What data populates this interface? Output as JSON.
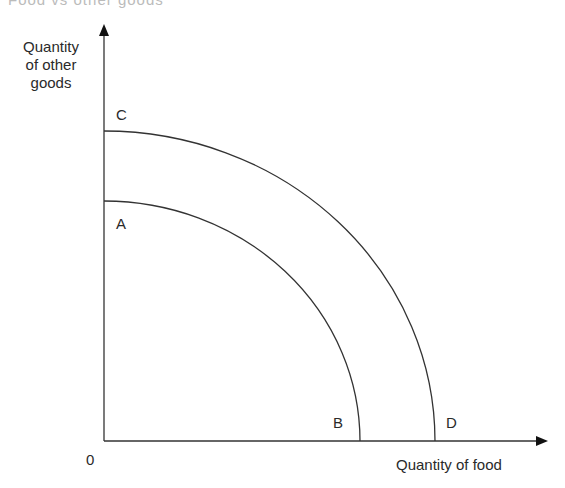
{
  "header": {
    "cut_text": "Food vs other goods"
  },
  "chart_data": {
    "type": "line",
    "title": "",
    "xlabel": "Quantity of food",
    "ylabel": "Quantity of other goods",
    "origin_label": "0",
    "curves": [
      {
        "name": "AB",
        "start_label": "A",
        "end_label": "B",
        "description": "Inner production possibility frontier"
      },
      {
        "name": "CD",
        "start_label": "C",
        "end_label": "D",
        "description": "Outer production possibility frontier"
      }
    ],
    "grid": false
  },
  "labels": {
    "y_axis": "Quantity of other goods",
    "x_axis": "Quantity of food",
    "origin": "0",
    "point_a": "A",
    "point_b": "B",
    "point_c": "C",
    "point_d": "D"
  },
  "colors": {
    "line": "#333333",
    "text": "#2a2a2a"
  }
}
